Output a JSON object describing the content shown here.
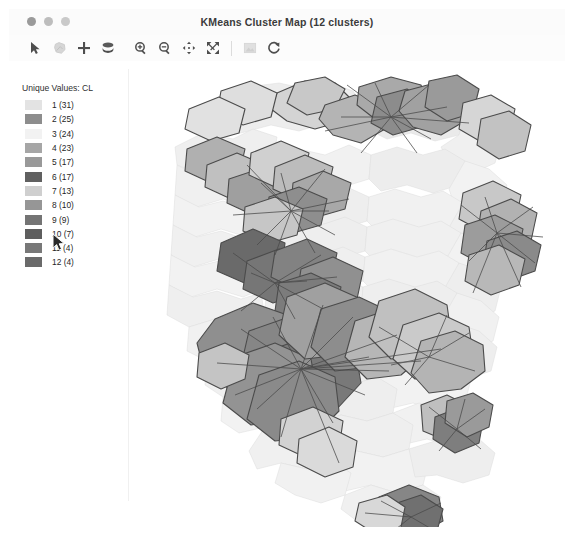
{
  "window": {
    "title": "KMeans Cluster Map (12 clusters)",
    "traffic_lights": [
      "close-button",
      "minimize-button",
      "zoom-button"
    ]
  },
  "toolbar": {
    "buttons": [
      {
        "name": "select-pointer-tool",
        "icon": "arrow-pointer-icon",
        "label": "Select"
      },
      {
        "name": "region-select-tool",
        "icon": "polygon-lasso-icon",
        "label": "Region Select"
      },
      {
        "name": "add-point-tool",
        "icon": "plus-icon",
        "label": "Add"
      },
      {
        "name": "layers-tool",
        "icon": "layers-stack-icon",
        "label": "Layers"
      },
      {
        "name": "zoom-in-tool",
        "icon": "magnifier-plus-icon",
        "label": "Zoom In"
      },
      {
        "name": "zoom-out-tool",
        "icon": "magnifier-minus-icon",
        "label": "Zoom Out"
      },
      {
        "name": "pan-tool",
        "icon": "pan-arrows-icon",
        "label": "Pan"
      },
      {
        "name": "zoom-extent-tool",
        "icon": "expand-arrows-icon",
        "label": "Full Extent"
      },
      {
        "name": "save-image-tool",
        "icon": "image-save-icon",
        "label": "Save Image"
      },
      {
        "name": "refresh-tool",
        "icon": "refresh-circular-arrow-icon",
        "label": "Refresh"
      }
    ]
  },
  "legend": {
    "title": "Unique Values: CL",
    "items": [
      {
        "value": "1",
        "count": "31",
        "label": "1 (31)",
        "color": "#e3e3e3"
      },
      {
        "value": "2",
        "count": "25",
        "label": "2 (25)",
        "color": "#8d8d8d"
      },
      {
        "value": "3",
        "count": "24",
        "label": "3 (24)",
        "color": "#f2f2f2"
      },
      {
        "value": "4",
        "count": "23",
        "label": "4 (23)",
        "color": "#a6a6a6"
      },
      {
        "value": "5",
        "count": "17",
        "label": "5 (17)",
        "color": "#999999"
      },
      {
        "value": "6",
        "count": "17",
        "label": "6 (17)",
        "color": "#606060"
      },
      {
        "value": "7",
        "count": "13",
        "label": "7 (13)",
        "color": "#cfcfcf"
      },
      {
        "value": "8",
        "count": "10",
        "label": "8 (10)",
        "color": "#969696"
      },
      {
        "value": "9",
        "count": "9",
        "label": "9 (9)",
        "color": "#747474"
      },
      {
        "value": "10",
        "count": "7",
        "label": "10 (7)",
        "color": "#5e5e5e"
      },
      {
        "value": "11",
        "count": "4",
        "label": "11 (4)",
        "color": "#787878"
      },
      {
        "value": "12",
        "count": "4",
        "label": "12 (4)",
        "color": "#6a6a6a"
      }
    ]
  },
  "map": {
    "name": "kmeans-cluster-choropleth",
    "background": "#ffffff",
    "outline_color": "#4b4b4b",
    "link_color": "#4a4a4a"
  },
  "cursor": {
    "name": "mouse-pointer",
    "x": 48,
    "y": 176
  }
}
